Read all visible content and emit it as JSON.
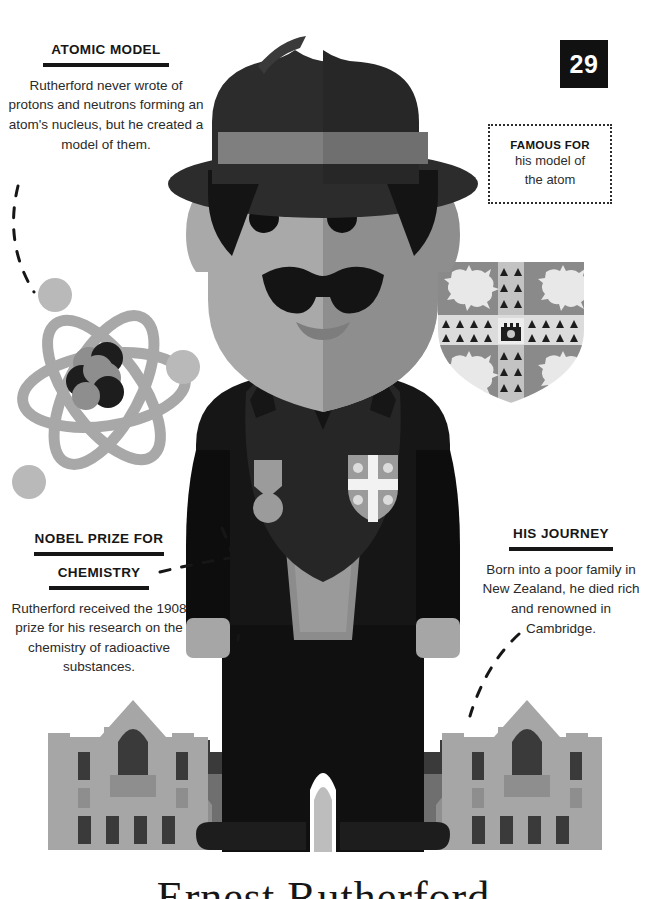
{
  "page": {
    "number": "29",
    "background_color": "#ffffff",
    "ink_color": "#161616",
    "bottom_title": "Ernest Rutherford"
  },
  "famous_for": {
    "title": "FAMOUS FOR",
    "line1": "his model of",
    "line2": "the atom"
  },
  "callouts": {
    "atomic_model": {
      "title": "ATOMIC MODEL",
      "body": "Rutherford never wrote of protons and neutrons forming an atom's nucleus, but he created a model of them."
    },
    "nobel_prize": {
      "title_line1": "NOBEL PRIZE FOR",
      "title_line2": "CHEMISTRY",
      "body": "Rutherford received the 1908 prize for his research on the chemistry of radioactive substances."
    },
    "his_journey": {
      "title": "HIS JOURNEY",
      "body": "Born into a poor family in New Zealand, he died rich and renowned in Cambridge."
    }
  },
  "illustration": {
    "subject": "portrait of Ernest Rutherford in hat and suit",
    "atom_diagram": {
      "orbit_count": 3,
      "electron_count": 3,
      "nucleus_particle_count": 6
    },
    "coat_of_arms": {
      "lion_count": 4,
      "ermine_group_count": 4,
      "center_emblem": "castle"
    },
    "lapel_badge": {
      "emblem": "cross-with-four-roundels"
    },
    "medal": {
      "ribbon": "pentagon",
      "disc": "circle"
    },
    "buildings": {
      "count": 2,
      "style": "gothic college facade with crenellations"
    }
  },
  "palette": {
    "black": "#111111",
    "coat_dark": "#2b2b2b",
    "shadow_dark": "#0b0b0b",
    "mid_gray": "#8e8e8e",
    "light_gray": "#b5b5b5",
    "pale_gray": "#c9c9c9",
    "face_light": "#a9a9a9",
    "face_dark": "#8c8c8c",
    "white": "#ffffff"
  }
}
